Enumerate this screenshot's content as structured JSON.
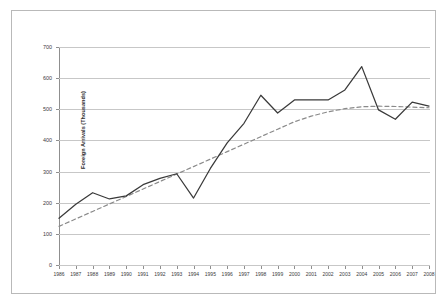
{
  "chart_data": {
    "type": "line",
    "title": "",
    "xlabel": "",
    "ylabel": "Foreign Arrivals (Thousands)",
    "ylim": [
      0,
      700
    ],
    "ytick_step": 100,
    "yticks": [
      "0",
      "100",
      "200",
      "300",
      "400",
      "500",
      "600",
      "700"
    ],
    "grid": true,
    "legend": "none",
    "categories": [
      "1986",
      "1987",
      "1988",
      "1989",
      "1990",
      "1991",
      "1992",
      "1993",
      "1994",
      "1995",
      "1996",
      "1997",
      "1998",
      "1999",
      "2000",
      "2001",
      "2002",
      "2003",
      "2004",
      "2005",
      "2006",
      "2007",
      "2008"
    ],
    "series": [
      {
        "name": "Foreign Arrivals",
        "style": "solid",
        "color": "#3a3a3a",
        "values": [
          150,
          195,
          232,
          212,
          222,
          258,
          278,
          293,
          215,
          310,
          392,
          455,
          545,
          488,
          530,
          530,
          530,
          562,
          637,
          498,
          468,
          523,
          510
        ]
      },
      {
        "name": "Trendline",
        "style": "dashed",
        "color": "#8a8a8a",
        "values": [
          124,
          148,
          172,
          196,
          220,
          244,
          268,
          292,
          316,
          340,
          364,
          388,
          412,
          436,
          460,
          478,
          492,
          502,
          508,
          510,
          509,
          507,
          505
        ]
      }
    ]
  },
  "axes": {
    "y_title": "Foreign Arrivals (Thousands)"
  }
}
